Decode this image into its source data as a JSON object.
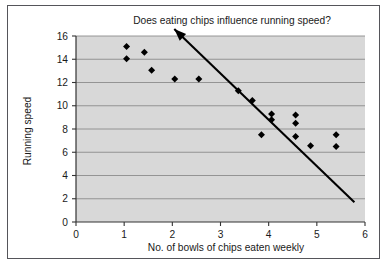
{
  "chart_data": {
    "type": "scatter",
    "title": "Does eating chips influence running speed?",
    "xlabel": "No. of bowls of chips eaten weekly",
    "ylabel": "Running speed",
    "xlim": [
      0,
      6
    ],
    "ylim": [
      0,
      16
    ],
    "xticks": [
      "0",
      "1",
      "2",
      "3",
      "4",
      "5",
      "6"
    ],
    "yticks": [
      "0",
      "2",
      "4",
      "6",
      "8",
      "10",
      "12",
      "14",
      "16"
    ],
    "grid": "horizontal",
    "legend": "none",
    "series": [
      {
        "name": "observations",
        "marker": "diamond",
        "color": "#000000",
        "points": [
          {
            "x": 1.05,
            "y": 15.1
          },
          {
            "x": 1.05,
            "y": 14.05
          },
          {
            "x": 1.42,
            "y": 14.6
          },
          {
            "x": 1.57,
            "y": 13.05
          },
          {
            "x": 2.05,
            "y": 12.3
          },
          {
            "x": 2.55,
            "y": 12.3
          },
          {
            "x": 3.37,
            "y": 11.3
          },
          {
            "x": 3.66,
            "y": 10.45
          },
          {
            "x": 3.85,
            "y": 7.5
          },
          {
            "x": 4.06,
            "y": 9.3
          },
          {
            "x": 4.06,
            "y": 8.8
          },
          {
            "x": 4.56,
            "y": 9.2
          },
          {
            "x": 4.56,
            "y": 8.5
          },
          {
            "x": 4.56,
            "y": 7.35
          },
          {
            "x": 4.87,
            "y": 6.55
          },
          {
            "x": 5.4,
            "y": 7.5
          },
          {
            "x": 5.4,
            "y": 6.5
          }
        ]
      }
    ],
    "annotations": [
      {
        "kind": "arrow",
        "label": "trend-arrow",
        "from": {
          "x": 5.78,
          "y": 1.7
        },
        "to": {
          "x": 2.04,
          "y": 16.6
        },
        "color": "#000000"
      }
    ],
    "colors": {
      "plot_background": "#d8d8d8",
      "gridline": "#8c8c8c",
      "axis": "#333333",
      "marker": "#000000",
      "frame": "#55555a",
      "page_background": "#ffffff",
      "text": "#1a1a1a"
    }
  }
}
